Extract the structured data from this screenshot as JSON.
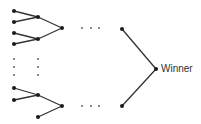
{
  "diagram": {
    "type": "tournament-bracket",
    "winner_label": "Winner",
    "colors": {
      "line": "#333333",
      "node": "#1a1a1a",
      "dots": "#555555"
    },
    "nodes": [
      {
        "id": "l1",
        "x": 14,
        "y": 11
      },
      {
        "id": "l2",
        "x": 14,
        "y": 22
      },
      {
        "id": "l3",
        "x": 14,
        "y": 33
      },
      {
        "id": "l4",
        "x": 14,
        "y": 44
      },
      {
        "id": "m1",
        "x": 38,
        "y": 17
      },
      {
        "id": "m2",
        "x": 38,
        "y": 39
      },
      {
        "id": "r1",
        "x": 62,
        "y": 28
      },
      {
        "id": "l5",
        "x": 14,
        "y": 88
      },
      {
        "id": "l6",
        "x": 14,
        "y": 100
      },
      {
        "id": "m3",
        "x": 38,
        "y": 95
      },
      {
        "id": "m4",
        "x": 38,
        "y": 117
      },
      {
        "id": "r2",
        "x": 62,
        "y": 106
      },
      {
        "id": "f1",
        "x": 122,
        "y": 29
      },
      {
        "id": "f2",
        "x": 122,
        "y": 106
      },
      {
        "id": "w",
        "x": 156,
        "y": 69
      }
    ],
    "edges": [
      [
        "l1",
        "m1"
      ],
      [
        "l2",
        "m1"
      ],
      [
        "l3",
        "m2"
      ],
      [
        "l4",
        "m2"
      ],
      [
        "m1",
        "r1"
      ],
      [
        "m2",
        "r1"
      ],
      [
        "l5",
        "m3"
      ],
      [
        "l6",
        "m3"
      ],
      [
        "m3",
        "r2"
      ],
      [
        "m4",
        "r2"
      ],
      [
        "f1",
        "w"
      ],
      [
        "f2",
        "w"
      ]
    ],
    "ellipsis_dots": [
      {
        "x": 82,
        "y": 28
      },
      {
        "x": 91,
        "y": 28
      },
      {
        "x": 99,
        "y": 28
      },
      {
        "x": 82,
        "y": 106
      },
      {
        "x": 91,
        "y": 106
      },
      {
        "x": 99,
        "y": 106
      },
      {
        "x": 14,
        "y": 59
      },
      {
        "x": 14,
        "y": 67
      },
      {
        "x": 14,
        "y": 75
      },
      {
        "x": 38,
        "y": 59
      },
      {
        "x": 38,
        "y": 67
      },
      {
        "x": 38,
        "y": 75
      }
    ]
  }
}
